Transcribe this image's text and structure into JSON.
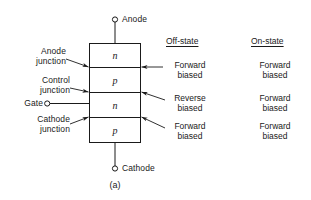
{
  "figure": {
    "caption": "(a)",
    "background_color": "#ffffff",
    "line_color": "#1a1a1a"
  },
  "device": {
    "type": "four-layer thyristor cross-section",
    "layers": [
      {
        "id": "layer-n1",
        "letter": "n"
      },
      {
        "id": "layer-p1",
        "letter": "p"
      },
      {
        "id": "layer-n2",
        "letter": "n"
      },
      {
        "id": "layer-p2",
        "letter": "p"
      }
    ]
  },
  "terminals": [
    {
      "id": "anode",
      "label": "Anode"
    },
    {
      "id": "gate",
      "label": "Gate"
    },
    {
      "id": "cathode",
      "label": "Cathode"
    }
  ],
  "junction_labels": [
    {
      "id": "anode-junction",
      "line1": "Anode",
      "line2": "junction"
    },
    {
      "id": "control-junction",
      "line1": "Control",
      "line2": "junction"
    },
    {
      "id": "cathode-junction",
      "line1": "Cathode",
      "line2": "junction"
    }
  ],
  "columns": [
    {
      "id": "off-state",
      "heading": "Off-state",
      "cells": [
        {
          "line1": "Forward",
          "line2": "biased"
        },
        {
          "line1": "Reverse",
          "line2": "biased"
        },
        {
          "line1": "Forward",
          "line2": "biased"
        }
      ]
    },
    {
      "id": "on-state",
      "heading": "On-state",
      "cells": [
        {
          "line1": "Forward",
          "line2": "biased"
        },
        {
          "line1": "Forward",
          "line2": "biased"
        },
        {
          "line1": "Forward",
          "line2": "biased"
        }
      ]
    }
  ]
}
